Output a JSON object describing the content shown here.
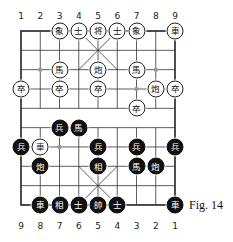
{
  "figure_label": "Fig. 14",
  "top_file_labels": [
    "1",
    "2",
    "3",
    "4",
    "5",
    "6",
    "7",
    "8",
    "9"
  ],
  "bottom_file_labels": [
    "9",
    "8",
    "7",
    "6",
    "5",
    "4",
    "3",
    "2",
    "1"
  ],
  "board": {
    "cols": 9,
    "rows": 10,
    "left": 21,
    "top": 31,
    "col_step": 19.25,
    "row_step": 19.33
  },
  "pieces": [
    {
      "side": "white",
      "char": "象",
      "col": 2,
      "row": 0
    },
    {
      "side": "white",
      "char": "士",
      "col": 3,
      "row": 0
    },
    {
      "side": "white",
      "char": "将",
      "col": 4,
      "row": 0
    },
    {
      "side": "white",
      "char": "士",
      "col": 5,
      "row": 0
    },
    {
      "side": "white",
      "char": "象",
      "col": 6,
      "row": 0
    },
    {
      "side": "white",
      "char": "車",
      "col": 8,
      "row": 0
    },
    {
      "side": "white",
      "char": "馬",
      "col": 2,
      "row": 2
    },
    {
      "side": "white",
      "char": "炮",
      "col": 4,
      "row": 2
    },
    {
      "side": "white",
      "char": "馬",
      "col": 6,
      "row": 2
    },
    {
      "side": "white",
      "char": "卒",
      "col": 0,
      "row": 3
    },
    {
      "side": "white",
      "char": "卒",
      "col": 2,
      "row": 3
    },
    {
      "side": "white",
      "char": "卒",
      "col": 4,
      "row": 3
    },
    {
      "side": "white",
      "char": "炮",
      "col": 7,
      "row": 3
    },
    {
      "side": "white",
      "char": "卒",
      "col": 8,
      "row": 3
    },
    {
      "side": "white",
      "char": "卒",
      "col": 6,
      "row": 4
    },
    {
      "side": "black",
      "char": "兵",
      "col": 2,
      "row": 5
    },
    {
      "side": "black",
      "char": "馬",
      "col": 3,
      "row": 5
    },
    {
      "side": "black",
      "char": "兵",
      "col": 0,
      "row": 6
    },
    {
      "side": "white",
      "char": "車",
      "col": 1,
      "row": 6
    },
    {
      "side": "black",
      "char": "兵",
      "col": 4,
      "row": 6
    },
    {
      "side": "black",
      "char": "兵",
      "col": 6,
      "row": 6
    },
    {
      "side": "black",
      "char": "兵",
      "col": 8,
      "row": 6
    },
    {
      "side": "black",
      "char": "炮",
      "col": 1,
      "row": 7
    },
    {
      "side": "black",
      "char": "相",
      "col": 4,
      "row": 7
    },
    {
      "side": "black",
      "char": "馬",
      "col": 6,
      "row": 7
    },
    {
      "side": "black",
      "char": "炮",
      "col": 7,
      "row": 7
    },
    {
      "side": "black",
      "char": "車",
      "col": 1,
      "row": 9
    },
    {
      "side": "black",
      "char": "相",
      "col": 2,
      "row": 9
    },
    {
      "side": "black",
      "char": "士",
      "col": 3,
      "row": 9
    },
    {
      "side": "black",
      "char": "帥",
      "col": 4,
      "row": 9
    },
    {
      "side": "black",
      "char": "士",
      "col": 5,
      "row": 9
    },
    {
      "side": "black",
      "char": "車",
      "col": 8,
      "row": 9
    }
  ],
  "markers": [
    {
      "col": 1,
      "row": 2
    },
    {
      "col": 7,
      "row": 2
    },
    {
      "col": 6,
      "row": 3
    },
    {
      "col": 2,
      "row": 6
    }
  ]
}
